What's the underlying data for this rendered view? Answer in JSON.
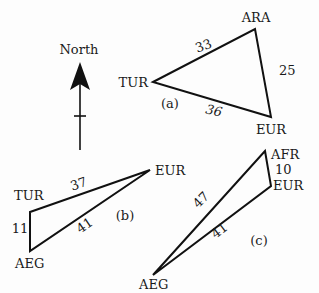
{
  "compass": {
    "label": "North"
  },
  "triangles": {
    "a": {
      "tag": "(a)",
      "vertices": {
        "tur": "TUR",
        "ara": "ARA",
        "eur": "EUR"
      },
      "edges": {
        "tur_ara": "33",
        "ara_eur": "25",
        "tur_eur": "36"
      }
    },
    "b": {
      "tag": "(b)",
      "vertices": {
        "tur": "TUR",
        "eur": "EUR",
        "aeg": "AEG"
      },
      "edges": {
        "tur_eur": "37",
        "tur_aeg": "11",
        "aeg_eur": "41"
      }
    },
    "c": {
      "tag": "(c)",
      "vertices": {
        "afr": "AFR",
        "eur": "EUR",
        "aeg": "AEG"
      },
      "edges": {
        "afr_eur": "10",
        "aeg_afr": "47",
        "aeg_eur": "41"
      }
    }
  }
}
